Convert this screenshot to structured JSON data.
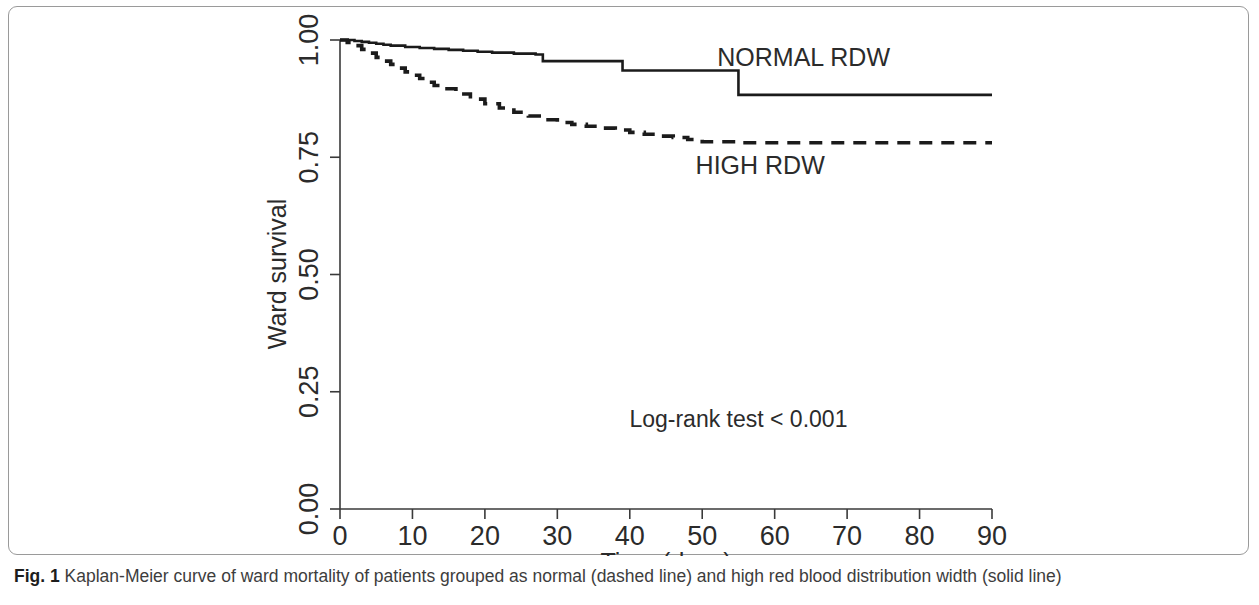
{
  "figure": {
    "caption_label": "Fig. 1",
    "caption_text": "Kaplan-Meier curve of ward mortality of patients grouped as normal (dashed line) and high red blood distribution width (solid line)"
  },
  "chart_data": {
    "type": "line",
    "subtype": "kaplan-meier-step",
    "title": "",
    "xlabel": "Time (days)",
    "ylabel": "Ward survival",
    "xlim": [
      0,
      90
    ],
    "ylim": [
      0.0,
      1.0
    ],
    "xticks": [
      0,
      10,
      20,
      30,
      40,
      50,
      60,
      70,
      80,
      90
    ],
    "xtick_labels": [
      "0",
      "10",
      "20",
      "30",
      "40",
      "50",
      "60",
      "70",
      "80",
      "90"
    ],
    "yticks": [
      0.0,
      0.25,
      0.5,
      0.75,
      1.0
    ],
    "ytick_labels": [
      "0.00",
      "0.25",
      "0.50",
      "0.75",
      "1.00"
    ],
    "grid": false,
    "legend_position": "inline-right",
    "annotations": [
      {
        "text": "Log-rank test < 0.001",
        "x": 55,
        "y": 0.175
      }
    ],
    "series": [
      {
        "name": "NORMAL RDW",
        "style": "solid",
        "label_x": 64,
        "label_y": 0.945,
        "x": [
          0,
          1,
          2,
          3,
          4,
          5,
          6,
          7,
          9,
          11,
          13,
          15,
          17,
          19,
          21,
          24,
          27,
          28,
          33,
          38,
          39,
          46,
          54,
          55,
          70,
          90
        ],
        "y": [
          1.0,
          1.0,
          0.998,
          0.996,
          0.994,
          0.992,
          0.99,
          0.988,
          0.985,
          0.983,
          0.981,
          0.979,
          0.977,
          0.975,
          0.973,
          0.971,
          0.969,
          0.955,
          0.955,
          0.955,
          0.935,
          0.935,
          0.935,
          0.883,
          0.883,
          0.883
        ]
      },
      {
        "name": "HIGH RDW",
        "style": "dashed",
        "label_x": 58,
        "label_y": 0.715,
        "x": [
          0,
          1,
          2,
          3,
          4,
          5,
          6,
          7,
          8,
          9,
          10,
          11,
          12,
          13,
          14,
          16,
          18,
          20,
          22,
          24,
          26,
          28,
          30,
          32,
          34,
          36,
          38,
          40,
          42,
          44,
          46,
          48,
          50,
          55,
          60,
          70,
          80,
          90
        ],
        "y": [
          1.0,
          0.995,
          0.988,
          0.98,
          0.972,
          0.963,
          0.955,
          0.948,
          0.94,
          0.932,
          0.925,
          0.918,
          0.91,
          0.903,
          0.896,
          0.885,
          0.874,
          0.864,
          0.855,
          0.846,
          0.838,
          0.83,
          0.824,
          0.82,
          0.816,
          0.812,
          0.808,
          0.803,
          0.799,
          0.795,
          0.792,
          0.788,
          0.783,
          0.781,
          0.781,
          0.781,
          0.781,
          0.781
        ]
      }
    ]
  },
  "colors": {
    "line": "#1b1b1b",
    "axis": "#3a3a3a",
    "frame": "#9a9a9a",
    "text": "#2b2b2b",
    "background": "#ffffff"
  }
}
